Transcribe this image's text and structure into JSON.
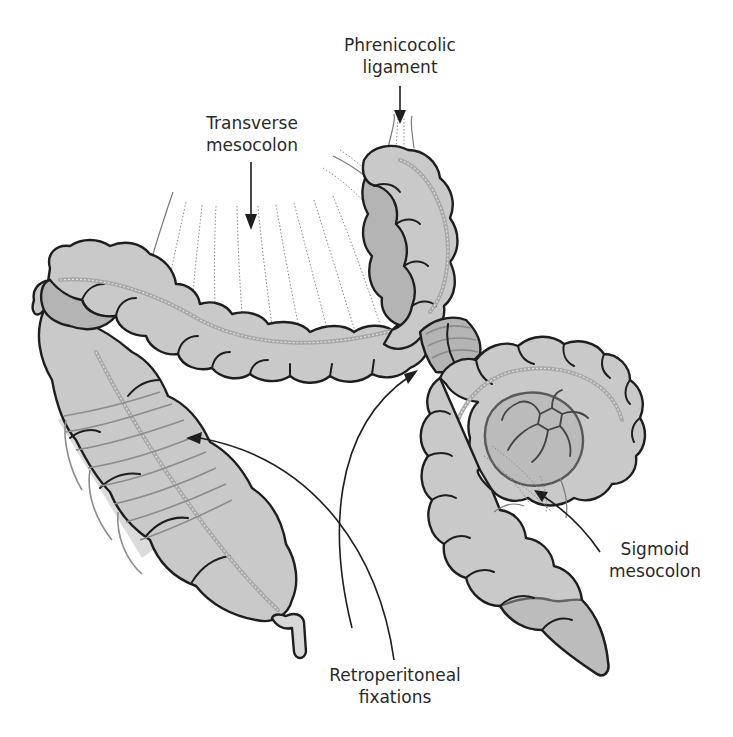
{
  "figure": {
    "colors": {
      "background": "#ffffff",
      "colon_fill": "#c9c9c9",
      "colon_shadow": "#b4b4b4",
      "outline": "#1e1e1e",
      "label_text": "#2a2a2a",
      "mesentery_lines": "#8a8a8a"
    }
  },
  "labels": {
    "phrenicocolic": {
      "line1": "Phrenicocolic",
      "line2": "ligament"
    },
    "transverse_mesocolon": {
      "line1": "Transverse",
      "line2": "mesocolon"
    },
    "sigmoid_mesocolon": {
      "line1": "Sigmoid",
      "line2": "mesocolon"
    },
    "retroperitoneal": {
      "line1": "Retroperitoneal",
      "line2": "fixations"
    }
  },
  "structures": [
    "transverse-colon",
    "splenic-flexure",
    "descending-colon",
    "ascending-colon",
    "cecum",
    "appendix",
    "sigmoid-colon",
    "rectum"
  ]
}
